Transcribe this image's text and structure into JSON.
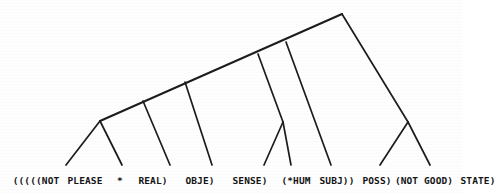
{
  "figure": {
    "kind": "parse-tree-diagram",
    "background_color": "#fefefe",
    "ink_color": "#1c1c1c",
    "width": 463,
    "height": 193
  },
  "leaves": [
    {
      "id": "leaf-open-parens-not",
      "text": "(((((NOT",
      "x": 36
    },
    {
      "id": "leaf-please",
      "text": "PLEASE",
      "x": 85
    },
    {
      "id": "leaf-star",
      "text": "*",
      "x": 120
    },
    {
      "id": "leaf-real",
      "text": "REAL)",
      "x": 153
    },
    {
      "id": "leaf-obje",
      "text": "OBJE)",
      "x": 200
    },
    {
      "id": "leaf-sense",
      "text": "SENSE)",
      "x": 250
    },
    {
      "id": "leaf-hum",
      "text": "(*HUM",
      "x": 296
    },
    {
      "id": "leaf-subj",
      "text": "SUBJ))",
      "x": 337
    },
    {
      "id": "leaf-poss",
      "text": "POSS)",
      "x": 377
    },
    {
      "id": "leaf-not-good",
      "text": "(NOT GOOD)",
      "x": 424
    },
    {
      "id": "leaf-state",
      "text": "STATE)",
      "x": 478
    }
  ],
  "full_text_line": "(((((NOT PLEASE * REAL)   OBJE)   SENSE)   (*HUM SUBJ))  POSS)(NOT GOOD) STATE)",
  "tree": {
    "apex": {
      "x": 342,
      "y": 14
    },
    "spine_start": {
      "x": 100,
      "y": 121
    },
    "nodes": [
      {
        "id": "node-left",
        "x": 100,
        "y": 121
      },
      {
        "id": "node-mid",
        "x": 283,
        "y": 122
      },
      {
        "id": "node-right",
        "x": 408,
        "y": 122
      },
      {
        "id": "node-apex",
        "x": 342,
        "y": 14
      }
    ],
    "edges": [
      {
        "id": "spine-main",
        "from": [
          100,
          121
        ],
        "to": [
          342,
          14
        ],
        "kind": "spine"
      },
      {
        "id": "edge-left-leaf1",
        "from": [
          100,
          121
        ],
        "to": [
          66,
          165
        ],
        "kind": "branch"
      },
      {
        "id": "edge-left-leaf2",
        "from": [
          100,
          121
        ],
        "to": [
          122,
          165
        ],
        "kind": "branch"
      },
      {
        "id": "edge-spine-leaf3",
        "from": [
          143,
          101
        ],
        "to": [
          170,
          165
        ],
        "kind": "branch"
      },
      {
        "id": "edge-spine-leaf4",
        "from": [
          185,
          82
        ],
        "to": [
          212,
          165
        ],
        "kind": "branch"
      },
      {
        "id": "edge-spine-node",
        "from": [
          258,
          54
        ],
        "to": [
          283,
          122
        ],
        "kind": "branch"
      },
      {
        "id": "edge-mid-leaf5",
        "from": [
          283,
          122
        ],
        "to": [
          264,
          165
        ],
        "kind": "branch"
      },
      {
        "id": "edge-mid-leaf6",
        "from": [
          283,
          122
        ],
        "to": [
          291,
          165
        ],
        "kind": "branch"
      },
      {
        "id": "edge-spine-leaf7",
        "from": [
          286,
          42
        ],
        "to": [
          331,
          165
        ],
        "kind": "branch"
      },
      {
        "id": "edge-apex-right",
        "from": [
          342,
          14
        ],
        "to": [
          408,
          122
        ],
        "kind": "branch"
      },
      {
        "id": "edge-right-leaf8",
        "from": [
          408,
          122
        ],
        "to": [
          380,
          165
        ],
        "kind": "branch"
      },
      {
        "id": "edge-right-leaf9",
        "from": [
          408,
          122
        ],
        "to": [
          430,
          165
        ],
        "kind": "branch"
      }
    ]
  }
}
